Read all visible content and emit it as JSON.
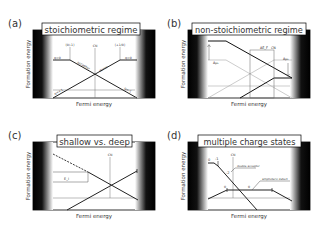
{
  "panels": [
    {
      "letter": "(a)",
      "title": "stoichiometric regime",
      "ylabel": "Formation energy",
      "xlabel": "Fermi energy",
      "annotations": {
        "transition_left": "(0/-1)",
        "transition_right": "(+1/0)",
        "cn": "CN",
        "q0_left": "q=0",
        "q0_right": "q=0",
        "acceptor": "acceptor",
        "donor": "donor",
        "q_plus1": "q=+1",
        "q_minus1": "q=-1"
      }
    },
    {
      "letter": "(b)",
      "title": "non-stoichiometric regime",
      "ylabel": "Formation energy",
      "xlabel": "Fermi energy",
      "annotations": {
        "delta_mu_left": "Δμ₁",
        "delta_ef": "ΔE_F",
        "cn": "CN",
        "delta_mu_right": "Δμ₂"
      }
    },
    {
      "letter": "(c)",
      "title": "shallow vs. deep",
      "ylabel": "Formation energy",
      "xlabel": "Fermi energy",
      "annotations": {
        "ei": "E_i",
        "cn": "CN"
      }
    },
    {
      "letter": "(d)",
      "title": "multiple charge states",
      "ylabel": "Formation energy",
      "xlabel": "Fermi energy",
      "annotations": {
        "q0": "0",
        "q_minus1": "-1",
        "q_minus2": "-2",
        "cn": "CN",
        "double_acceptor": "double acceptor",
        "amphoteric": "amphoteric defect",
        "zero_left": "0",
        "zero_mid": "0"
      }
    }
  ]
}
